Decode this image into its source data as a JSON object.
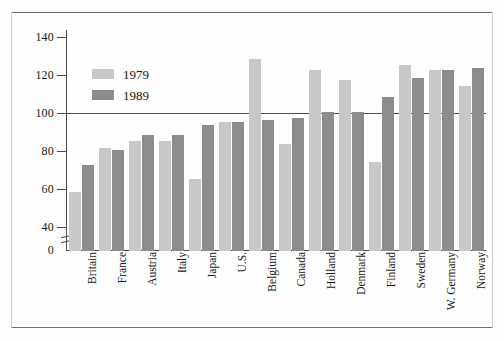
{
  "chart_data": {
    "type": "bar",
    "title": "",
    "subtitle": "",
    "xlabel": "",
    "ylabel": "",
    "ylim": [
      0,
      145
    ],
    "yticks": [
      0,
      40,
      60,
      80,
      100,
      120,
      140
    ],
    "ytick_labels": [
      "0",
      "40",
      "60",
      "80",
      "100",
      "120",
      "140"
    ],
    "axis_break": "between 0 and 40",
    "grid": false,
    "reference_line": 100,
    "legend_position": "upper left inside plot",
    "categories": [
      "Britain",
      "France",
      "Austria",
      "Italy",
      "Japan",
      "U.S.",
      "Belgium",
      "Canada",
      "Holland",
      "Denmark",
      "Finland",
      "Sweden",
      "W. Germany",
      "Norway"
    ],
    "series": [
      {
        "name": "1979",
        "color": "#c8c8c8",
        "values": [
          59,
          82,
          86,
          86,
          66,
          96,
          129,
          84,
          123,
          118,
          75,
          126,
          123,
          115
        ]
      },
      {
        "name": "1989",
        "color": "#8c8c8c",
        "values": [
          73,
          81,
          89,
          89,
          94,
          96,
          97,
          98,
          101,
          101,
          109,
          119,
          123,
          124
        ]
      }
    ]
  },
  "legend": {
    "items": [
      {
        "label": "1979",
        "swatch": "s1979"
      },
      {
        "label": "1989",
        "swatch": "s1989"
      }
    ]
  },
  "colors": {
    "series_1979": "#c8c8c8",
    "series_1989": "#8c8c8c",
    "axis": "#4a4a4a",
    "frame": "#6e6e6e",
    "background": "#fefefe"
  }
}
